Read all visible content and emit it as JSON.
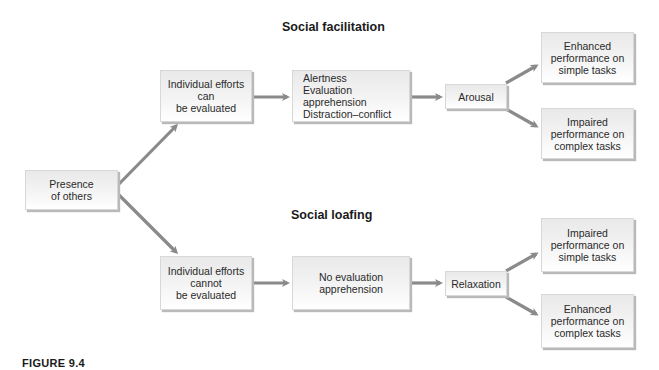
{
  "diagram": {
    "sections": {
      "facilitation_title": "Social facilitation",
      "loafing_title": "Social loafing"
    },
    "nodes": {
      "presence": "Presence\nof others",
      "can_evaluate": "Individual efforts\ncan\nbe evaluated",
      "facilitation_factors": "Alertness\nEvaluation apprehension\nDistraction–conflict",
      "arousal": "Arousal",
      "fac_simple": "Enhanced\nperformance on\nsimple tasks",
      "fac_complex": "Impaired\nperformance on\ncomplex tasks",
      "cannot_evaluate": "Individual efforts\ncannot\nbe evaluated",
      "no_evaluation": "No evaluation\napprehension",
      "relaxation": "Relaxation",
      "loaf_simple": "Impaired\nperformance on\nsimple tasks",
      "loaf_complex": "Enhanced\nperformance on\ncomplex tasks"
    },
    "edges": [
      [
        "presence",
        "can_evaluate"
      ],
      [
        "presence",
        "cannot_evaluate"
      ],
      [
        "can_evaluate",
        "facilitation_factors"
      ],
      [
        "facilitation_factors",
        "arousal"
      ],
      [
        "arousal",
        "fac_simple"
      ],
      [
        "arousal",
        "fac_complex"
      ],
      [
        "cannot_evaluate",
        "no_evaluation"
      ],
      [
        "no_evaluation",
        "relaxation"
      ],
      [
        "relaxation",
        "loaf_simple"
      ],
      [
        "relaxation",
        "loaf_complex"
      ]
    ],
    "colors": {
      "arrow": "#8a8a8a",
      "box_top": "#e9e9e9",
      "box_bottom": "#ffffff",
      "shadow": "#b9b9b9"
    },
    "caption": "FIGURE 9.4"
  }
}
